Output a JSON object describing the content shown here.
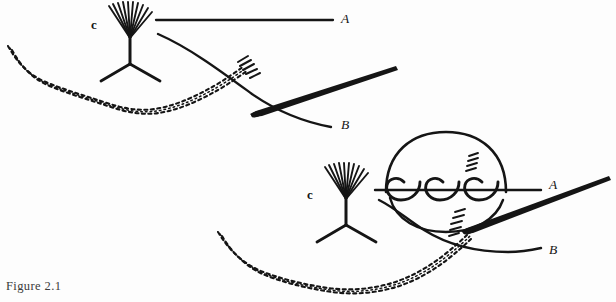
{
  "figure": {
    "caption": "Figure 2.1",
    "panels": [
      {
        "id": "top-panel",
        "name": "needle-and-strands-before-wrap",
        "labels": [
          {
            "name": "strand-label-a",
            "text": "A",
            "x": 341,
            "y": 18
          },
          {
            "name": "strand-label-b",
            "text": "B",
            "x": 341,
            "y": 124
          },
          {
            "name": "instrument-tip-marker",
            "text": "c",
            "x": 93,
            "y": 25
          }
        ],
        "elements": [
          "suture-strand-a",
          "suture-strand-b",
          "surgical-needle",
          "needle-holder-fan",
          "tissue-edge-hatched",
          "needle-entry-hatch"
        ]
      },
      {
        "id": "bottom-panel",
        "name": "needle-with-triple-coil-loop",
        "labels": [
          {
            "name": "strand-label-a",
            "text": "A",
            "x": 549,
            "y": 184
          },
          {
            "name": "strand-label-b",
            "text": "B",
            "x": 549,
            "y": 249
          },
          {
            "name": "instrument-tip-marker",
            "text": "c",
            "x": 309,
            "y": 195
          }
        ],
        "elements": [
          "suture-strand-a",
          "suture-strand-b",
          "surgical-needle",
          "needle-holder-fan",
          "tissue-edge-hatched",
          "suture-loop-circle",
          "coil-wrap-1",
          "coil-wrap-2",
          "coil-wrap-3",
          "needle-entry-hatch"
        ]
      }
    ],
    "colors": {
      "ink": "#151515",
      "background": "#fdfdfd",
      "caption": "#3a3a3a"
    }
  }
}
